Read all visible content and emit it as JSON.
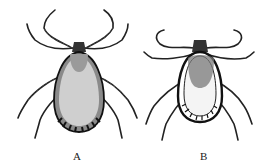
{
  "figure": {
    "panels": [
      {
        "label": "A",
        "subject": "tick-female-dorsal",
        "color": "#1a1a1a"
      },
      {
        "label": "B",
        "subject": "tick-male-dorsal",
        "color": "#1a1a1a"
      }
    ]
  }
}
